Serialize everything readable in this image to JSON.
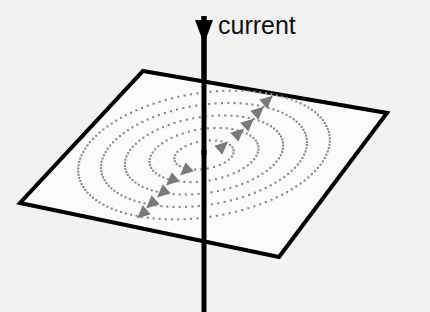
{
  "figure": {
    "background_color": "#f2f2f2",
    "labels": {
      "current": "current"
    },
    "label_positions": {
      "current": {
        "x": 218,
        "y": 13,
        "font_size": 25,
        "color": "#111111"
      }
    },
    "wire": {
      "name": "current-wire",
      "color": "#000000",
      "stroke_width": 5,
      "x": 204,
      "y_top": 8,
      "y_bottom": 312,
      "arrow": {
        "name": "current-direction-arrow",
        "direction": "down",
        "tip_x": 204,
        "tip_y": 44,
        "half_width": 9,
        "base_y": 16,
        "color": "#000000"
      }
    },
    "plane": {
      "name": "reference-plane",
      "fill": "#fbfbfb",
      "stroke": "#000000",
      "stroke_width": 4,
      "corners": [
        {
          "label": "top",
          "x": 143,
          "y": 71
        },
        {
          "x": 387,
          "y": 113
        },
        {
          "label": "bottom",
          "x": 279,
          "y": 257
        },
        {
          "label": "left",
          "x": 20,
          "y": 203
        }
      ]
    },
    "field_lines": {
      "name": "magnetic-field-lines",
      "style": "dotted-ellipse",
      "count": 5,
      "dot_color": "#8a8a8a",
      "dot_size": 2.1,
      "dot_spacing": 5.0,
      "center": {
        "x": 204,
        "y": 155
      },
      "rotation_deg": -9,
      "rings": [
        {
          "index": 1,
          "rx": 30,
          "ry": 14
        },
        {
          "index": 2,
          "rx": 55,
          "ry": 26
        },
        {
          "index": 3,
          "rx": 80,
          "ry": 38
        },
        {
          "index": 4,
          "rx": 104,
          "ry": 50
        },
        {
          "index": 5,
          "rx": 127,
          "ry": 62
        }
      ]
    },
    "direction_arrows": {
      "name": "field-direction-arrowheads",
      "color": "#7a7a7a",
      "count": 10,
      "size": 13,
      "items": [
        {
          "id": "right-1",
          "x": 222,
          "y": 147,
          "angle": -42
        },
        {
          "id": "right-2",
          "x": 238,
          "y": 134,
          "angle": -42
        },
        {
          "id": "right-3",
          "x": 248,
          "y": 124,
          "angle": -42
        },
        {
          "id": "right-4",
          "x": 258,
          "y": 112,
          "angle": -42
        },
        {
          "id": "right-5",
          "x": 267,
          "y": 101,
          "angle": -42
        },
        {
          "id": "left-1",
          "x": 186,
          "y": 170,
          "angle": 138
        },
        {
          "id": "left-2",
          "x": 172,
          "y": 180,
          "angle": 138
        },
        {
          "id": "left-3",
          "x": 163,
          "y": 192,
          "angle": 138
        },
        {
          "id": "left-4",
          "x": 152,
          "y": 203,
          "angle": 138
        },
        {
          "id": "left-5",
          "x": 143,
          "y": 213,
          "angle": 138
        }
      ]
    }
  }
}
